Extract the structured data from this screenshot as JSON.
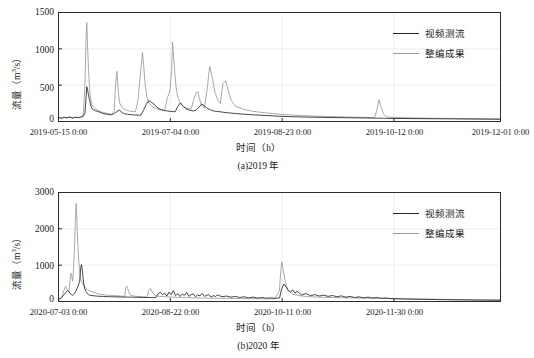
{
  "figure": {
    "series_colors": {
      "video": "#262626",
      "compiled": "#9a9a9a"
    },
    "legend": {
      "video_label": "视频测流",
      "compiled_label": "整编成果"
    }
  },
  "panel_a": {
    "caption": "(a)2019 年",
    "xlabel": "时间（h）",
    "ylabel_main": "流量",
    "ylabel_unit": "（m3/s）",
    "yticks": [
      "0",
      "500",
      "1000",
      "1500"
    ],
    "xticks": [
      "2019-05-15 0:00",
      "2019-07-04 0:00",
      "2019-08-23 0:00",
      "2019-10-12 0:00",
      "2019-12-01 0:00"
    ]
  },
  "panel_b": {
    "caption": "(b)2020 年",
    "xlabel": "时间（h）",
    "ylabel_main": "流量",
    "ylabel_unit": "（m3/s）",
    "yticks": [
      "0",
      "1000",
      "2000",
      "3000"
    ],
    "xticks": [
      "2020-07-03 0:00",
      "2020-08-22 0:00",
      "2020-10-11 0:00",
      "2020-11-30 0:00"
    ]
  },
  "chart_data": [
    {
      "id": "panel_a",
      "type": "line",
      "title": "(a)2019 年",
      "xlabel": "时间（h）",
      "ylabel": "流量（m3/s）",
      "ylim": [
        0,
        1500
      ],
      "yticks": [
        0,
        500,
        1000,
        1500
      ],
      "xtick_labels": [
        "2019-05-15 0:00",
        "2019-07-04 0:00",
        "2019-08-23 0:00",
        "2019-10-12 0:00",
        "2019-12-01 0:00"
      ],
      "xtick_positions": [
        0.0,
        0.253,
        0.506,
        0.759,
        1.0
      ],
      "grid": true,
      "legend_position": "upper right",
      "series": [
        {
          "name": "视频测流",
          "color": "#262626",
          "x": [
            0,
            0.004,
            0.008,
            0.012,
            0.016,
            0.02,
            0.024,
            0.028,
            0.032,
            0.036,
            0.04,
            0.044,
            0.048,
            0.052,
            0.056,
            0.06,
            0.062,
            0.064,
            0.066,
            0.068,
            0.07,
            0.072,
            0.074,
            0.076,
            0.08,
            0.084,
            0.088,
            0.092,
            0.096,
            0.1,
            0.105,
            0.11,
            0.115,
            0.12,
            0.126,
            0.132,
            0.138,
            0.144,
            0.15,
            0.156,
            0.162,
            0.168,
            0.174,
            0.18,
            0.186,
            0.192,
            0.198,
            0.204,
            0.21,
            0.216,
            0.222,
            0.228,
            0.234,
            0.24,
            0.246,
            0.252,
            0.258,
            0.264,
            0.27,
            0.276,
            0.282,
            0.288,
            0.294,
            0.3,
            0.306,
            0.312,
            0.318,
            0.324,
            0.33,
            0.336,
            0.342,
            0.348,
            0.354,
            0.36,
            0.37,
            0.38,
            0.39,
            0.4,
            0.42,
            0.44,
            0.46,
            0.5,
            0.55,
            0.6,
            0.65,
            0.7,
            0.72,
            0.73,
            0.735,
            0.74,
            0.75,
            0.8,
            0.85,
            0.9,
            0.95,
            1.0
          ],
          "y": [
            48,
            52,
            44,
            60,
            55,
            50,
            62,
            58,
            46,
            55,
            60,
            52,
            58,
            64,
            70,
            120,
            300,
            480,
            430,
            360,
            300,
            250,
            200,
            175,
            160,
            145,
            140,
            132,
            120,
            112,
            105,
            100,
            96,
            92,
            110,
            135,
            160,
            120,
            105,
            100,
            95,
            92,
            90,
            88,
            86,
            150,
            230,
            285,
            265,
            240,
            200,
            175,
            160,
            150,
            145,
            140,
            138,
            135,
            210,
            255,
            210,
            175,
            160,
            150,
            145,
            160,
            200,
            240,
            215,
            185,
            165,
            150,
            142,
            138,
            130,
            122,
            116,
            110,
            100,
            92,
            86,
            72,
            62,
            56,
            52,
            48,
            46,
            45,
            44,
            43,
            42,
            40,
            38,
            36,
            34,
            32
          ]
        },
        {
          "name": "整编成果",
          "color": "#9a9a9a",
          "x": [
            0,
            0.004,
            0.008,
            0.012,
            0.016,
            0.02,
            0.024,
            0.028,
            0.032,
            0.036,
            0.04,
            0.044,
            0.048,
            0.052,
            0.056,
            0.06,
            0.062,
            0.064,
            0.066,
            0.068,
            0.07,
            0.072,
            0.074,
            0.076,
            0.08,
            0.084,
            0.088,
            0.092,
            0.096,
            0.1,
            0.105,
            0.11,
            0.115,
            0.12,
            0.126,
            0.129,
            0.132,
            0.135,
            0.138,
            0.144,
            0.15,
            0.156,
            0.162,
            0.168,
            0.174,
            0.18,
            0.186,
            0.19,
            0.192,
            0.196,
            0.2,
            0.204,
            0.21,
            0.216,
            0.222,
            0.228,
            0.234,
            0.24,
            0.246,
            0.252,
            0.256,
            0.258,
            0.262,
            0.266,
            0.27,
            0.276,
            0.282,
            0.288,
            0.294,
            0.3,
            0.306,
            0.312,
            0.316,
            0.318,
            0.322,
            0.326,
            0.33,
            0.336,
            0.342,
            0.348,
            0.354,
            0.36,
            0.366,
            0.372,
            0.378,
            0.384,
            0.39,
            0.4,
            0.42,
            0.44,
            0.46,
            0.5,
            0.55,
            0.6,
            0.65,
            0.7,
            0.715,
            0.72,
            0.725,
            0.73,
            0.735,
            0.74,
            0.75,
            0.8,
            0.85,
            0.9,
            0.95,
            1.0
          ],
          "y": [
            45,
            50,
            42,
            58,
            52,
            48,
            60,
            55,
            44,
            52,
            58,
            50,
            56,
            62,
            90,
            520,
            1100,
            1360,
            1000,
            700,
            480,
            350,
            280,
            230,
            195,
            170,
            158,
            148,
            135,
            125,
            118,
            110,
            104,
            100,
            140,
            500,
            690,
            440,
            260,
            190,
            165,
            150,
            142,
            138,
            134,
            300,
            700,
            950,
            820,
            520,
            330,
            260,
            215,
            190,
            175,
            165,
            158,
            152,
            320,
            420,
            700,
            1090,
            760,
            470,
            330,
            250,
            210,
            190,
            178,
            170,
            300,
            400,
            410,
            330,
            250,
            205,
            185,
            430,
            760,
            600,
            400,
            300,
            250,
            520,
            560,
            430,
            300,
            210,
            165,
            140,
            125,
            100,
            82,
            70,
            62,
            56,
            52,
            150,
            300,
            200,
            110,
            70,
            58,
            50,
            44,
            40,
            36,
            32
          ]
        }
      ]
    },
    {
      "id": "panel_b",
      "type": "line",
      "title": "(b)2020 年",
      "xlabel": "时间（h）",
      "ylabel": "流量（m3/s）",
      "ylim": [
        0,
        3000
      ],
      "yticks": [
        0,
        1000,
        2000,
        3000
      ],
      "xtick_labels": [
        "2020-07-03 0:00",
        "2020-08-22 0:00",
        "2020-10-11 0:00",
        "2020-11-30 0:00"
      ],
      "xtick_positions": [
        0.0,
        0.253,
        0.506,
        0.759
      ],
      "grid": true,
      "legend_position": "upper right",
      "series": [
        {
          "name": "视频测流",
          "color": "#262626",
          "x": [
            0,
            0.004,
            0.008,
            0.012,
            0.016,
            0.02,
            0.024,
            0.028,
            0.032,
            0.036,
            0.04,
            0.044,
            0.048,
            0.05,
            0.052,
            0.054,
            0.056,
            0.058,
            0.06,
            0.062,
            0.064,
            0.066,
            0.068,
            0.07,
            0.074,
            0.078,
            0.082,
            0.086,
            0.09,
            0.1,
            0.11,
            0.12,
            0.13,
            0.14,
            0.15,
            0.16,
            0.17,
            0.18,
            0.19,
            0.2,
            0.21,
            0.22,
            0.225,
            0.23,
            0.235,
            0.24,
            0.245,
            0.25,
            0.255,
            0.26,
            0.265,
            0.27,
            0.275,
            0.28,
            0.285,
            0.29,
            0.295,
            0.3,
            0.305,
            0.31,
            0.315,
            0.32,
            0.325,
            0.33,
            0.335,
            0.34,
            0.345,
            0.35,
            0.355,
            0.36,
            0.37,
            0.38,
            0.39,
            0.4,
            0.41,
            0.42,
            0.43,
            0.44,
            0.45,
            0.46,
            0.47,
            0.48,
            0.49,
            0.5,
            0.505,
            0.51,
            0.515,
            0.52,
            0.525,
            0.53,
            0.535,
            0.54,
            0.55,
            0.56,
            0.57,
            0.58,
            0.59,
            0.6,
            0.61,
            0.62,
            0.63,
            0.64,
            0.65,
            0.66,
            0.67,
            0.68,
            0.69,
            0.7,
            0.71,
            0.72,
            0.73,
            0.74,
            0.75,
            0.78,
            0.82,
            0.86,
            0.9,
            0.95,
            1.0
          ],
          "y": [
            60,
            80,
            120,
            180,
            240,
            300,
            260,
            200,
            170,
            220,
            300,
            420,
            560,
            900,
            1020,
            850,
            600,
            430,
            330,
            280,
            240,
            210,
            190,
            175,
            165,
            160,
            155,
            150,
            145,
            140,
            135,
            130,
            128,
            125,
            122,
            120,
            118,
            115,
            112,
            110,
            108,
            105,
            210,
            250,
            190,
            230,
            150,
            260,
            190,
            300,
            160,
            220,
            140,
            200,
            170,
            250,
            140,
            190,
            210,
            130,
            180,
            160,
            220,
            140,
            170,
            190,
            120,
            160,
            140,
            180,
            130,
            150,
            120,
            140,
            110,
            130,
            100,
            120,
            95,
            110,
            90,
            100,
            88,
            95,
            350,
            480,
            400,
            300,
            260,
            320,
            230,
            280,
            180,
            220,
            160,
            190,
            150,
            175,
            140,
            165,
            130,
            155,
            120,
            140,
            110,
            130,
            100,
            120,
            95,
            110,
            88,
            100,
            80,
            70,
            60,
            52,
            46,
            40,
            36
          ]
        },
        {
          "name": "整编成果",
          "color": "#9a9a9a",
          "x": [
            0,
            0.004,
            0.008,
            0.012,
            0.016,
            0.02,
            0.024,
            0.026,
            0.028,
            0.03,
            0.032,
            0.034,
            0.036,
            0.038,
            0.04,
            0.042,
            0.044,
            0.046,
            0.048,
            0.05,
            0.054,
            0.058,
            0.062,
            0.066,
            0.07,
            0.074,
            0.078,
            0.082,
            0.086,
            0.09,
            0.1,
            0.11,
            0.12,
            0.13,
            0.14,
            0.15,
            0.152,
            0.155,
            0.158,
            0.162,
            0.17,
            0.18,
            0.19,
            0.2,
            0.205,
            0.208,
            0.212,
            0.218,
            0.23,
            0.25,
            0.27,
            0.29,
            0.31,
            0.33,
            0.35,
            0.38,
            0.41,
            0.44,
            0.47,
            0.49,
            0.5,
            0.502,
            0.505,
            0.508,
            0.512,
            0.516,
            0.52,
            0.53,
            0.55,
            0.57,
            0.6,
            0.63,
            0.66,
            0.7,
            0.74,
            0.78,
            0.82,
            0.86,
            0.9,
            0.95,
            1.0
          ],
          "y": [
            55,
            75,
            150,
            300,
            420,
            340,
            280,
            560,
            780,
            700,
            560,
            900,
            1400,
            2200,
            2700,
            2100,
            1500,
            1100,
            800,
            620,
            500,
            420,
            360,
            320,
            300,
            280,
            260,
            240,
            225,
            210,
            190,
            175,
            165,
            158,
            150,
            145,
            380,
            420,
            300,
            180,
            150,
            140,
            132,
            125,
            330,
            360,
            260,
            160,
            140,
            125,
            115,
            108,
            100,
            95,
            90,
            85,
            80,
            78,
            75,
            74,
            300,
            700,
            1090,
            900,
            620,
            420,
            300,
            200,
            150,
            130,
            115,
            105,
            98,
            90,
            82,
            75,
            68,
            60,
            52,
            44,
            38
          ]
        }
      ]
    }
  ]
}
